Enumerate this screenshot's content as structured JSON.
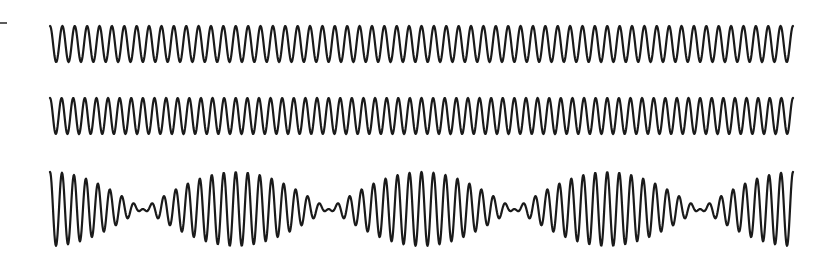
{
  "figure": {
    "background": "#ffffff",
    "stroke_color": "#1a1a1a",
    "marker": {
      "x1": 0,
      "x2": 7,
      "y": 23
    },
    "x_start": 50,
    "x_end": 793,
    "waves": [
      {
        "name": "wave-1",
        "center_y": 44,
        "amplitude": 18,
        "cycles": 60,
        "phase": 1.5708,
        "type": "single"
      },
      {
        "name": "wave-2",
        "center_y": 116,
        "amplitude": 18,
        "cycles": 64,
        "phase": 1.5708,
        "type": "single"
      },
      {
        "name": "wave-sum",
        "center_y": 209,
        "amplitude": 18.5,
        "cycles_a": 60,
        "cycles_b": 64,
        "phase": 1.5708,
        "type": "sum"
      }
    ]
  }
}
